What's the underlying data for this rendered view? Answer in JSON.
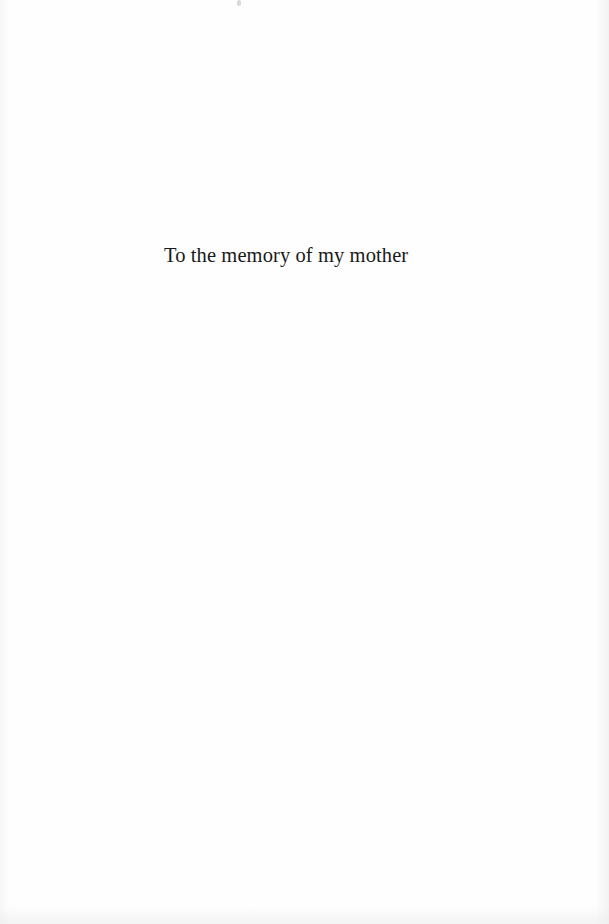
{
  "page": {
    "type": "dedication",
    "dedication_text": "To the memory of my mother"
  }
}
